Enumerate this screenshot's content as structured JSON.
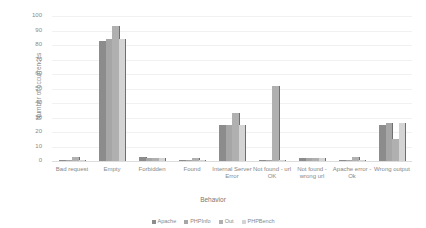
{
  "chart_data": {
    "type": "bar",
    "title": "",
    "xlabel": "Behavior",
    "ylabel": "Number of occurrences",
    "ylim": [
      0,
      100
    ],
    "yticks": [
      0,
      10,
      20,
      30,
      40,
      50,
      60,
      70,
      80,
      90,
      100
    ],
    "grid": true,
    "legend_position": "bottom",
    "categories": [
      "Bad request",
      "Empty",
      "Forbidden",
      "Found",
      "Internal Server Error",
      "Not found - url OK",
      "Not found - wrong url",
      "Apache error - Ok",
      "Wrong output"
    ],
    "series": [
      {
        "name": "Apache",
        "color": "#8c8c8c",
        "values": [
          1,
          83,
          3,
          1,
          25,
          1,
          2,
          1,
          25
        ]
      },
      {
        "name": "PHPInfo",
        "color": "#a6a6a6",
        "values": [
          1,
          84,
          2,
          1,
          25,
          1,
          2,
          1,
          26
        ]
      },
      {
        "name": "Out",
        "color": "#b0b0b0",
        "values": [
          3,
          93,
          2,
          2,
          33,
          52,
          2,
          3,
          15
        ]
      },
      {
        "name": "PHPBench",
        "color": "#d4d4d4",
        "values": [
          1,
          84,
          2,
          1,
          25,
          1,
          2,
          1,
          26
        ]
      }
    ]
  }
}
